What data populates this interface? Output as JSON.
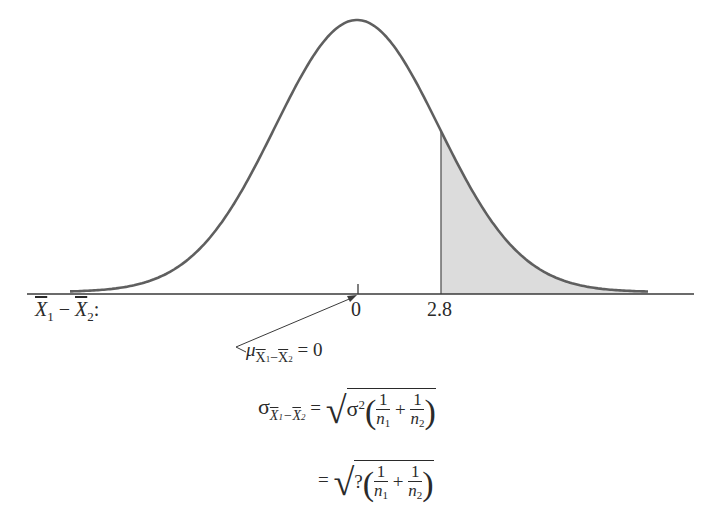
{
  "chart_data": {
    "type": "area",
    "title": "",
    "distribution": "normal",
    "mean": 0,
    "shaded_region": {
      "from": 2.8,
      "to": "+inf",
      "tail": "right"
    },
    "x_axis": {
      "label": "X̄₁ − X̄₂:",
      "ticks": [
        {
          "value": 0,
          "label": "0"
        },
        {
          "value": 2.8,
          "label": "2.8"
        }
      ]
    },
    "colors": {
      "curve": "#5a5a5a",
      "shade": "#dcdcdc",
      "axis": "#3a3a3a"
    },
    "grid": false,
    "legend": null
  },
  "axis": {
    "variable_label": "X̄₁ − X̄₂:",
    "tick_zero_label": "0",
    "tick_cut_label": "2.8"
  },
  "annotations": {
    "mean_label": {
      "symbol": "μ",
      "subscript": "X̄₁−X̄₂",
      "equals": "= 0"
    },
    "sd_formula": {
      "symbol": "σ",
      "subscript": "X̄₁−X̄₂",
      "line1": {
        "equals": "=",
        "radicand_coef": "σ",
        "radicand_exp": "2",
        "frac1_num": "1",
        "frac1_den": "n",
        "frac1_den_sub": "1",
        "plus": "+",
        "frac2_num": "1",
        "frac2_den": "n",
        "frac2_den_sub": "2"
      },
      "line2": {
        "equals": "=",
        "radicand_coef": "?",
        "frac1_num": "1",
        "frac1_den": "n",
        "frac1_den_sub": "1",
        "plus": "+",
        "frac2_num": "1",
        "frac2_den": "n",
        "frac2_den_sub": "2"
      }
    }
  }
}
